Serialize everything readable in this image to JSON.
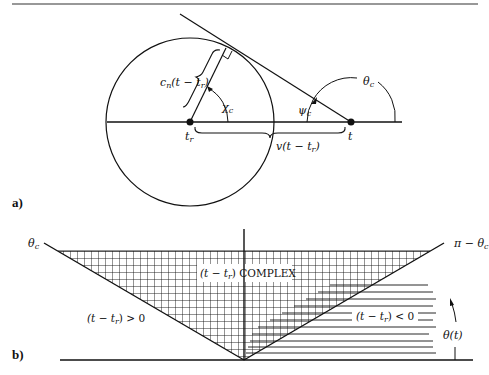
{
  "panel_a": {
    "label": "a)",
    "radius_label": "c_n(t − t_r)",
    "radius_label_main": "c",
    "radius_label_sub": "n",
    "radius_label_rest": "(t − t",
    "radius_label_sub2": "r",
    "radius_label_end": ")",
    "chi_label": "χ",
    "chi_sub": "c",
    "psi_label": "ψ",
    "psi_sub": "c",
    "theta_label": "θ",
    "theta_sub": "c",
    "tr_label": "t",
    "tr_sub": "r",
    "t_label": "t",
    "distance_label": "v(t − t",
    "distance_sub": "r",
    "distance_end": ")"
  },
  "panel_b": {
    "label": "b)",
    "left_angle_label": "θ",
    "left_angle_sub": "c",
    "right_angle_label": "π − θ",
    "right_angle_sub": "c",
    "complex_region_label_pre": "(t − t",
    "complex_region_sub": "r",
    "complex_region_label_post": ") COMPLEX",
    "positive_region_pre": "(t − t",
    "positive_region_sub": "r",
    "positive_region_post": ") > 0",
    "negative_region_pre": "(t − t",
    "negative_region_sub": "r",
    "negative_region_post": ") < 0",
    "theta_t_label": "θ(t)"
  }
}
